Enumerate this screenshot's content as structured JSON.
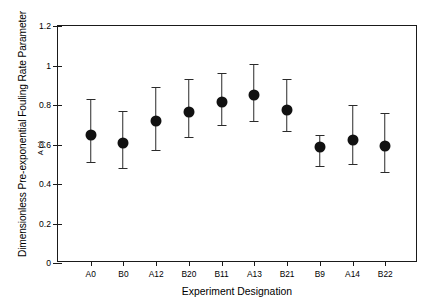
{
  "chart_data": {
    "type": "scatter",
    "title": "",
    "xlabel": "Experiment Designation",
    "ylabel": "Dimensionless Pre-exponential Fouling Rate Parameter",
    "ylabel_sub": "A (-)",
    "ylim": [
      0,
      1.2
    ],
    "yticks": [
      0,
      0.2,
      0.4,
      0.6,
      0.8,
      1,
      1.2
    ],
    "ytick_labels": [
      "0",
      "0.2",
      "0.4",
      "0.6",
      "0.8",
      "1",
      "1.2"
    ],
    "grid": false,
    "legend": null,
    "categories": [
      "A0",
      "B0",
      "A12",
      "B20",
      "B11",
      "A13",
      "B21",
      "B9",
      "A14",
      "B22"
    ],
    "values": [
      0.65,
      0.61,
      0.72,
      0.765,
      0.815,
      0.85,
      0.775,
      0.585,
      0.625,
      0.59
    ],
    "err_low": [
      0.51,
      0.48,
      0.57,
      0.64,
      0.7,
      0.72,
      0.67,
      0.49,
      0.5,
      0.46
    ],
    "err_high": [
      0.83,
      0.77,
      0.89,
      0.93,
      0.96,
      1.01,
      0.93,
      0.65,
      0.8,
      0.76
    ],
    "marker_color": "#111111",
    "errorbar_color": "#2b2b2b",
    "axis_color": "#1a1a1a",
    "background": "#ffffff"
  }
}
